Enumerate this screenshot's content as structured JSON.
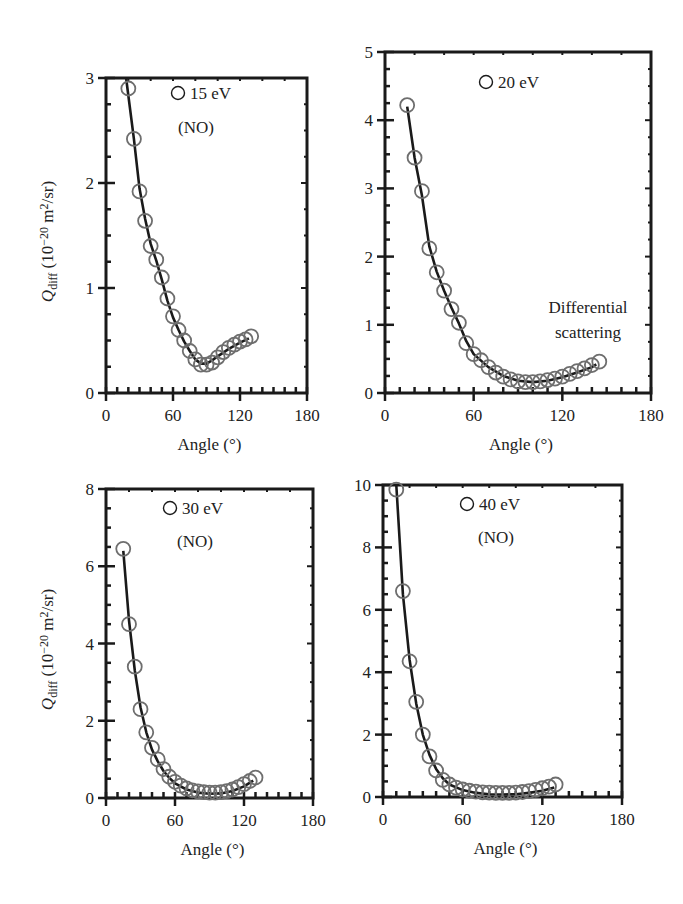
{
  "figure": {
    "ylabel_main": "Q",
    "ylabel_sub": "diff",
    "ylabel_units_prefix": " (10",
    "ylabel_units_exp": "−20",
    "ylabel_units_mid": " m",
    "ylabel_units_exp2": "2",
    "ylabel_units_suffix": "/sr)",
    "xlabel": "Angle (°)",
    "colors": {
      "axis": "#1a1a1a",
      "line": "#1a1a1a",
      "marker": "#6e6e6e"
    }
  },
  "chart_data": [
    {
      "id": "panel-15ev",
      "type": "scatter",
      "title": "",
      "legend": "15 eV",
      "annotation": "(NO)",
      "xlabel": "Angle (°)",
      "ylabel": "Q_diff (10^-20 m^2/sr)",
      "xlim": [
        0,
        180
      ],
      "ylim": [
        0,
        3
      ],
      "xticks": [
        0,
        60,
        120,
        180
      ],
      "yticks": [
        0,
        1,
        2,
        3
      ],
      "y_minor_step": 0.25,
      "x_minor_step": 10,
      "show_ylabel": true,
      "box": {
        "left": 106,
        "right": 307,
        "top": 78,
        "bottom": 393
      },
      "legend_pos": {
        "x": 186,
        "y": 99
      },
      "annotation_pos": {
        "x": 196,
        "y": 133
      },
      "series": [
        {
          "name": "15 eV measured",
          "style": "open-circle",
          "x": [
            20,
            25,
            30,
            35,
            40,
            45,
            50,
            55,
            60,
            65,
            70,
            75,
            80,
            85,
            90,
            95,
            100,
            105,
            110,
            115,
            120,
            125,
            130
          ],
          "y": [
            2.9,
            2.42,
            1.92,
            1.64,
            1.4,
            1.27,
            1.1,
            0.9,
            0.73,
            0.6,
            0.5,
            0.4,
            0.32,
            0.27,
            0.27,
            0.29,
            0.34,
            0.39,
            0.43,
            0.46,
            0.49,
            0.51,
            0.54
          ]
        },
        {
          "name": "15 eV fit",
          "style": "line",
          "x": [
            18,
            25,
            30,
            35,
            40,
            45,
            50,
            55,
            60,
            65,
            70,
            75,
            80,
            85,
            90,
            95,
            100,
            110,
            120,
            128
          ],
          "y": [
            3.0,
            2.42,
            1.95,
            1.66,
            1.42,
            1.26,
            1.08,
            0.88,
            0.72,
            0.6,
            0.49,
            0.4,
            0.32,
            0.28,
            0.28,
            0.31,
            0.35,
            0.42,
            0.48,
            0.52
          ]
        }
      ]
    },
    {
      "id": "panel-20ev",
      "type": "scatter",
      "title": "",
      "legend": "20 eV",
      "annotation": "Differential scattering",
      "annotation_lines": [
        "Differential",
        "scattering"
      ],
      "xlabel": "Angle (°)",
      "ylabel": "",
      "xlim": [
        0,
        180
      ],
      "ylim": [
        0,
        5
      ],
      "xticks": [
        0,
        60,
        120,
        180
      ],
      "yticks": [
        0,
        1,
        2,
        3,
        4,
        5
      ],
      "y_minor_step": 0.25,
      "x_minor_step": 10,
      "show_ylabel": false,
      "box": {
        "left": 385,
        "right": 651,
        "top": 52,
        "bottom": 393
      },
      "legend_pos": {
        "x": 494,
        "y": 88
      },
      "annotation_pos": {
        "x": 588,
        "y": 313
      },
      "series": [
        {
          "name": "20 eV measured",
          "style": "open-circle",
          "x": [
            15,
            20,
            25,
            30,
            35,
            40,
            45,
            50,
            55,
            60,
            65,
            70,
            75,
            80,
            85,
            90,
            95,
            100,
            105,
            110,
            115,
            120,
            125,
            130,
            135,
            140,
            145
          ],
          "y": [
            4.22,
            3.45,
            2.96,
            2.12,
            1.77,
            1.5,
            1.23,
            1.03,
            0.73,
            0.57,
            0.48,
            0.38,
            0.3,
            0.24,
            0.2,
            0.17,
            0.16,
            0.16,
            0.17,
            0.19,
            0.21,
            0.24,
            0.28,
            0.32,
            0.36,
            0.41,
            0.46
          ]
        },
        {
          "name": "20 eV fit",
          "style": "line",
          "x": [
            15,
            20,
            25,
            30,
            35,
            40,
            45,
            50,
            55,
            60,
            70,
            80,
            90,
            100,
            110,
            120,
            130,
            140,
            143
          ],
          "y": [
            4.2,
            3.45,
            2.9,
            2.15,
            1.78,
            1.5,
            1.25,
            1.02,
            0.76,
            0.57,
            0.38,
            0.25,
            0.18,
            0.16,
            0.18,
            0.23,
            0.3,
            0.38,
            0.42
          ]
        }
      ]
    },
    {
      "id": "panel-30ev",
      "type": "scatter",
      "title": "",
      "legend": "30 eV",
      "annotation": "(NO)",
      "xlabel": "Angle (°)",
      "ylabel": "Q_diff (10^-20 m^2/sr)",
      "xlim": [
        0,
        180
      ],
      "ylim": [
        0,
        8
      ],
      "xticks": [
        0,
        60,
        120,
        180
      ],
      "yticks": [
        0,
        2,
        4,
        6,
        8
      ],
      "y_minor_step": 0.5,
      "x_minor_step": 10,
      "show_ylabel": true,
      "box": {
        "left": 106,
        "right": 313,
        "top": 489,
        "bottom": 798
      },
      "legend_pos": {
        "x": 178,
        "y": 514
      },
      "annotation_pos": {
        "x": 195,
        "y": 547
      },
      "series": [
        {
          "name": "30 eV measured",
          "style": "open-circle",
          "x": [
            15,
            20,
            25,
            30,
            35,
            40,
            45,
            50,
            55,
            60,
            65,
            70,
            75,
            80,
            85,
            90,
            95,
            100,
            105,
            110,
            115,
            120,
            125,
            130
          ],
          "y": [
            6.45,
            4.5,
            3.4,
            2.3,
            1.7,
            1.3,
            1.0,
            0.75,
            0.55,
            0.42,
            0.32,
            0.25,
            0.2,
            0.17,
            0.15,
            0.14,
            0.14,
            0.15,
            0.18,
            0.22,
            0.28,
            0.36,
            0.44,
            0.53
          ]
        },
        {
          "name": "30 eV fit",
          "style": "line",
          "x": [
            15,
            20,
            25,
            30,
            35,
            40,
            45,
            50,
            55,
            60,
            70,
            80,
            90,
            100,
            110,
            120,
            128
          ],
          "y": [
            6.4,
            4.6,
            3.3,
            2.35,
            1.7,
            1.25,
            0.95,
            0.7,
            0.52,
            0.38,
            0.22,
            0.14,
            0.11,
            0.12,
            0.18,
            0.3,
            0.45
          ]
        }
      ]
    },
    {
      "id": "panel-40ev",
      "type": "scatter",
      "title": "",
      "legend": "40 eV",
      "annotation": "(NO)",
      "xlabel": "Angle (°)",
      "ylabel": "",
      "xlim": [
        0,
        180
      ],
      "ylim": [
        0,
        10
      ],
      "xticks": [
        0,
        60,
        120,
        180
      ],
      "yticks": [
        0,
        2,
        4,
        6,
        8,
        10
      ],
      "y_minor_step": 0.5,
      "x_minor_step": 10,
      "show_ylabel": false,
      "box": {
        "left": 383,
        "right": 622,
        "top": 485,
        "bottom": 797
      },
      "legend_pos": {
        "x": 475,
        "y": 510
      },
      "annotation_pos": {
        "x": 496,
        "y": 543
      },
      "series": [
        {
          "name": "40 eV measured",
          "style": "open-circle",
          "x": [
            10,
            15,
            20,
            25,
            30,
            35,
            40,
            45,
            50,
            55,
            60,
            65,
            70,
            75,
            80,
            85,
            90,
            95,
            100,
            105,
            110,
            115,
            120,
            125,
            130
          ],
          "y": [
            9.85,
            6.6,
            4.35,
            3.05,
            2.0,
            1.3,
            0.85,
            0.55,
            0.4,
            0.3,
            0.24,
            0.2,
            0.17,
            0.15,
            0.14,
            0.13,
            0.13,
            0.13,
            0.14,
            0.16,
            0.19,
            0.23,
            0.28,
            0.33,
            0.4
          ]
        },
        {
          "name": "40 eV fit",
          "style": "line",
          "x": [
            10,
            15,
            20,
            25,
            30,
            35,
            40,
            45,
            50,
            60,
            70,
            80,
            90,
            100,
            110,
            120,
            129
          ],
          "y": [
            10.0,
            6.5,
            4.4,
            3.0,
            2.0,
            1.35,
            0.9,
            0.6,
            0.4,
            0.22,
            0.13,
            0.09,
            0.08,
            0.09,
            0.13,
            0.2,
            0.3
          ]
        }
      ]
    }
  ]
}
